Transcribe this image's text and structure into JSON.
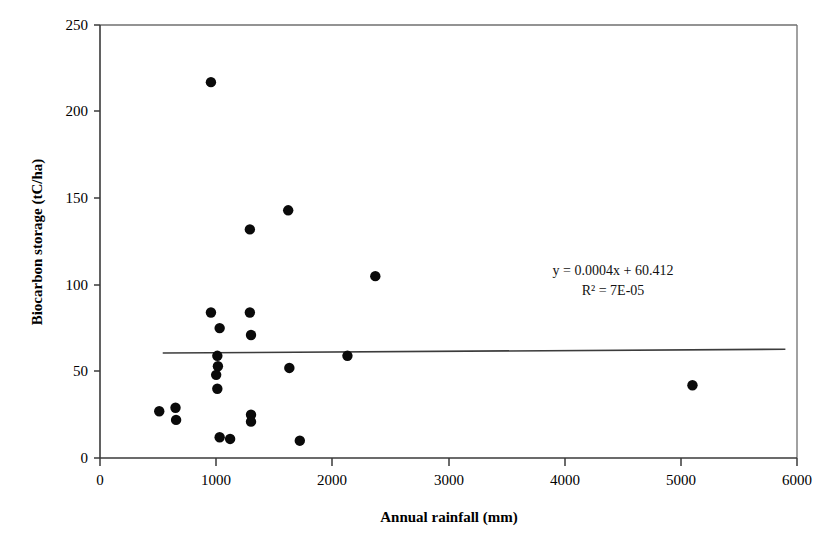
{
  "chart_data": {
    "type": "scatter",
    "title": "",
    "xlabel": "Annual rainfall (mm)",
    "ylabel": "Biocarbon storage (tC/ha)",
    "xlim": [
      0,
      6000
    ],
    "ylim": [
      0,
      250
    ],
    "xticks": [
      0,
      1000,
      2000,
      3000,
      4000,
      5000,
      6000
    ],
    "yticks": [
      0,
      50,
      100,
      150,
      200,
      250
    ],
    "xtick_labels": [
      "0",
      "1000",
      "2000",
      "3000",
      "4000",
      "5000",
      "6000"
    ],
    "ytick_labels": [
      "0",
      "50",
      "100",
      "150",
      "200",
      "250"
    ],
    "grid": false,
    "legend": null,
    "marker": "filled-circle",
    "marker_color": "#0a0a0a",
    "points": [
      {
        "x": 510,
        "y": 27
      },
      {
        "x": 650,
        "y": 29
      },
      {
        "x": 655,
        "y": 22
      },
      {
        "x": 955,
        "y": 217
      },
      {
        "x": 955,
        "y": 84
      },
      {
        "x": 1030,
        "y": 75
      },
      {
        "x": 1010,
        "y": 59
      },
      {
        "x": 1015,
        "y": 53
      },
      {
        "x": 1000,
        "y": 48
      },
      {
        "x": 1010,
        "y": 40
      },
      {
        "x": 1030,
        "y": 12
      },
      {
        "x": 1120,
        "y": 11
      },
      {
        "x": 1290,
        "y": 132
      },
      {
        "x": 1290,
        "y": 84
      },
      {
        "x": 1300,
        "y": 71
      },
      {
        "x": 1300,
        "y": 25
      },
      {
        "x": 1300,
        "y": 21
      },
      {
        "x": 1620,
        "y": 143
      },
      {
        "x": 1630,
        "y": 52
      },
      {
        "x": 1720,
        "y": 10
      },
      {
        "x": 2130,
        "y": 59
      },
      {
        "x": 2370,
        "y": 105
      },
      {
        "x": 5100,
        "y": 42
      }
    ],
    "trendline": {
      "type": "linear",
      "slope": 0.0004,
      "intercept": 60.412,
      "x_start": 540,
      "x_end": 5900,
      "equation": "y = 0.0004x + 60.412",
      "r_squared_label": "R² = 7E-05"
    },
    "annotations": [
      {
        "name": "regression-equation",
        "text": "y = 0.0004x + 60.412"
      },
      {
        "name": "r-squared",
        "text": "R² = 7E-05"
      }
    ]
  }
}
